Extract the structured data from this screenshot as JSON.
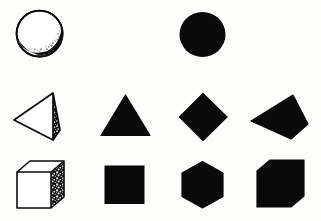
{
  "figure": {
    "background_color": "#fdfdfb",
    "ink_color": "#0a0a0a",
    "width": 321,
    "height": 221,
    "rows": 3,
    "columns": 4
  },
  "shapes": [
    {
      "id": "sphere-shaded",
      "name": "sphere",
      "row": 1,
      "column": 1,
      "rendering": "outline-with-stipple-shading",
      "fill": "#ffffff",
      "stroke": "#0a0a0a",
      "bbox": {
        "x": 16,
        "y": 10,
        "w": 48,
        "h": 48
      }
    },
    {
      "id": "circle-solid",
      "name": "circle",
      "row": 1,
      "column": 3,
      "rendering": "solid-silhouette",
      "fill": "#0a0a0a",
      "stroke": "none",
      "bbox": {
        "x": 180,
        "y": 12,
        "w": 46,
        "h": 45
      }
    },
    {
      "id": "tetrahedron-wireframe",
      "name": "tetrahedron",
      "row": 2,
      "column": 1,
      "rendering": "outline-with-stipple-shading",
      "fill": "#ffffff",
      "stroke": "#0a0a0a",
      "bbox": {
        "x": 13,
        "y": 92,
        "w": 50,
        "h": 48
      }
    },
    {
      "id": "triangle-solid",
      "name": "triangle",
      "row": 2,
      "column": 2,
      "rendering": "solid-silhouette",
      "fill": "#0a0a0a",
      "stroke": "none",
      "bbox": {
        "x": 101,
        "y": 95,
        "w": 49,
        "h": 41
      }
    },
    {
      "id": "diamond-solid",
      "name": "diamond",
      "row": 2,
      "column": 3,
      "rendering": "solid-silhouette",
      "fill": "#0a0a0a",
      "stroke": "none",
      "bbox": {
        "x": 180,
        "y": 94,
        "w": 48,
        "h": 46
      }
    },
    {
      "id": "tetrahedron-silhouette",
      "name": "tetrahedron-silhouette",
      "row": 2,
      "column": 4,
      "rendering": "solid-silhouette",
      "fill": "#0a0a0a",
      "stroke": "none",
      "bbox": {
        "x": 251,
        "y": 95,
        "w": 58,
        "h": 45
      }
    },
    {
      "id": "cube-wireframe",
      "name": "cube",
      "row": 3,
      "column": 1,
      "rendering": "outline-with-stipple-shading",
      "fill": "#ffffff",
      "stroke": "#0a0a0a",
      "bbox": {
        "x": 16,
        "y": 161,
        "w": 48,
        "h": 48
      }
    },
    {
      "id": "square-solid",
      "name": "square",
      "row": 3,
      "column": 2,
      "rendering": "solid-silhouette",
      "fill": "#0a0a0a",
      "stroke": "none",
      "bbox": {
        "x": 104,
        "y": 165,
        "w": 41,
        "h": 39
      }
    },
    {
      "id": "hexagon-solid",
      "name": "hexagon",
      "row": 3,
      "column": 3,
      "rendering": "solid-silhouette",
      "fill": "#0a0a0a",
      "stroke": "none",
      "bbox": {
        "x": 180,
        "y": 162,
        "w": 46,
        "h": 46
      }
    },
    {
      "id": "cube-silhouette",
      "name": "cube-silhouette",
      "row": 3,
      "column": 4,
      "rendering": "solid-silhouette",
      "fill": "#0a0a0a",
      "stroke": "none",
      "bbox": {
        "x": 256,
        "y": 160,
        "w": 50,
        "h": 49
      }
    }
  ]
}
